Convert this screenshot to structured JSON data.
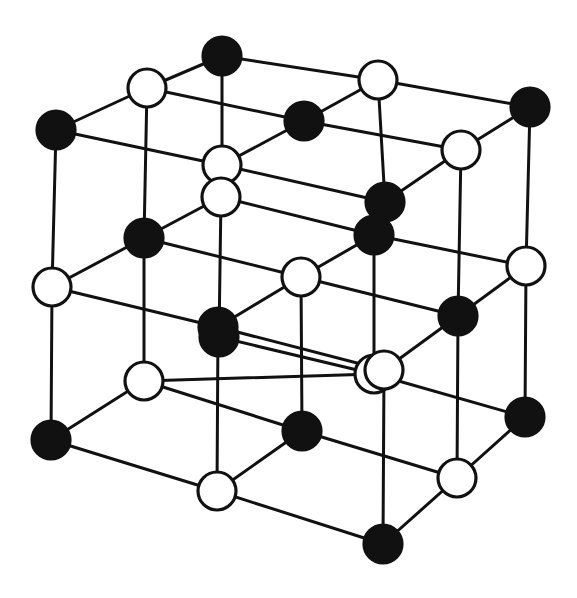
{
  "diagram": {
    "title": "Crystal lattice (rock-salt structure) exploded view",
    "colors": {
      "dark_atom": "#111111",
      "light_atom": "#ffffff",
      "bond": "#111111",
      "background": "#ffffff"
    },
    "atom_radius": 19,
    "atoms": [
      {
        "id": "a1",
        "type": "dark",
        "x": 222,
        "y": 56
      },
      {
        "id": "a2",
        "type": "light",
        "x": 147,
        "y": 88
      },
      {
        "id": "a3",
        "type": "light",
        "x": 378,
        "y": 80
      },
      {
        "id": "a4",
        "type": "dark",
        "x": 304,
        "y": 121
      },
      {
        "id": "a5",
        "type": "dark",
        "x": 530,
        "y": 107
      },
      {
        "id": "a6",
        "type": "dark",
        "x": 56,
        "y": 130
      },
      {
        "id": "a7",
        "type": "light",
        "x": 222,
        "y": 165
      },
      {
        "id": "a8",
        "type": "light",
        "x": 461,
        "y": 150
      },
      {
        "id": "a9",
        "type": "dark",
        "x": 385,
        "y": 202
      },
      {
        "id": "a10",
        "type": "light",
        "x": 221,
        "y": 197
      },
      {
        "id": "a11",
        "type": "dark",
        "x": 144,
        "y": 238
      },
      {
        "id": "a12",
        "type": "dark",
        "x": 374,
        "y": 235
      },
      {
        "id": "a13",
        "type": "light",
        "x": 52,
        "y": 287
      },
      {
        "id": "a14",
        "type": "light",
        "x": 301,
        "y": 277
      },
      {
        "id": "a15",
        "type": "light",
        "x": 526,
        "y": 266
      },
      {
        "id": "a16",
        "type": "dark",
        "x": 218,
        "y": 327
      },
      {
        "id": "a17",
        "type": "dark",
        "x": 458,
        "y": 316
      },
      {
        "id": "a18",
        "type": "dark",
        "x": 219,
        "y": 337
      },
      {
        "id": "a19",
        "type": "light",
        "x": 374,
        "y": 374
      },
      {
        "id": "a20",
        "type": "light",
        "x": 384,
        "y": 370
      },
      {
        "id": "a21",
        "type": "light",
        "x": 144,
        "y": 381
      },
      {
        "id": "a22",
        "type": "dark",
        "x": 51,
        "y": 440
      },
      {
        "id": "a23",
        "type": "dark",
        "x": 302,
        "y": 431
      },
      {
        "id": "a24",
        "type": "dark",
        "x": 525,
        "y": 417
      },
      {
        "id": "a25",
        "type": "light",
        "x": 217,
        "y": 491
      },
      {
        "id": "a26",
        "type": "light",
        "x": 457,
        "y": 478
      },
      {
        "id": "a27",
        "type": "dark",
        "x": 383,
        "y": 544
      }
    ],
    "bonds": [
      [
        "a1",
        "a2"
      ],
      [
        "a1",
        "a3"
      ],
      [
        "a2",
        "a6"
      ],
      [
        "a2",
        "a4"
      ],
      [
        "a3",
        "a4"
      ],
      [
        "a3",
        "a5"
      ],
      [
        "a6",
        "a7"
      ],
      [
        "a4",
        "a7"
      ],
      [
        "a4",
        "a8"
      ],
      [
        "a5",
        "a8"
      ],
      [
        "a7",
        "a9"
      ],
      [
        "a8",
        "a9"
      ],
      [
        "a1",
        "a7"
      ],
      [
        "a2",
        "a11"
      ],
      [
        "a6",
        "a13"
      ],
      [
        "a3",
        "a9"
      ],
      [
        "a5",
        "a15"
      ],
      [
        "a8",
        "a17"
      ],
      [
        "a10",
        "a11"
      ],
      [
        "a10",
        "a12"
      ],
      [
        "a11",
        "a13"
      ],
      [
        "a11",
        "a14"
      ],
      [
        "a12",
        "a14"
      ],
      [
        "a12",
        "a15"
      ],
      [
        "a13",
        "a16"
      ],
      [
        "a14",
        "a16"
      ],
      [
        "a14",
        "a17"
      ],
      [
        "a15",
        "a17"
      ],
      [
        "a16",
        "a20"
      ],
      [
        "a17",
        "a20"
      ],
      [
        "a10",
        "a18"
      ],
      [
        "a12",
        "a19"
      ],
      [
        "a18",
        "a19"
      ],
      [
        "a13",
        "a22"
      ],
      [
        "a16",
        "a25"
      ],
      [
        "a17",
        "a26"
      ],
      [
        "a15",
        "a24"
      ],
      [
        "a20",
        "a27"
      ],
      [
        "a11",
        "a21"
      ],
      [
        "a14",
        "a23"
      ],
      [
        "a21",
        "a22"
      ],
      [
        "a21",
        "a23"
      ],
      [
        "a22",
        "a25"
      ],
      [
        "a23",
        "a25"
      ],
      [
        "a23",
        "a26"
      ],
      [
        "a24",
        "a26"
      ],
      [
        "a25",
        "a27"
      ],
      [
        "a26",
        "a27"
      ],
      [
        "a19",
        "a21"
      ],
      [
        "a19",
        "a24"
      ]
    ]
  }
}
